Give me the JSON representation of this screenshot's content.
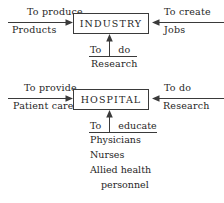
{
  "diagram": {
    "title_hidden": "",
    "stroke_color": "#3a3a3a",
    "text_color": "#262626",
    "entities": [
      {
        "id": "industry",
        "label": "INDUSTRY"
      },
      {
        "id": "hospital",
        "label": "HOSPITAL"
      }
    ],
    "industry_row": {
      "left_arrow": {
        "above": "To  produce",
        "below": "Products",
        "direction": "right",
        "icon": "arrow-right-icon"
      },
      "right_arrow": {
        "above": "To  create",
        "below": "Jobs",
        "direction": "left",
        "icon": "arrow-left-icon"
      },
      "bottom_arrow": {
        "above_left": "To",
        "above_right": "do",
        "below": "Research",
        "direction": "up",
        "icon": "arrow-up-icon"
      }
    },
    "hospital_row": {
      "left_arrow": {
        "above": "To  provide",
        "below": "Patient  care",
        "direction": "right",
        "icon": "arrow-right-icon"
      },
      "right_arrow": {
        "above": "To  do",
        "below": "Research",
        "direction": "left",
        "icon": "arrow-left-icon"
      },
      "bottom_arrow": {
        "above_left": "To",
        "above_right": "educate",
        "direction": "up",
        "icon": "arrow-up-icon",
        "below_list": [
          "Physicians",
          "Nurses",
          "Allied  health",
          "personnel"
        ]
      }
    }
  }
}
